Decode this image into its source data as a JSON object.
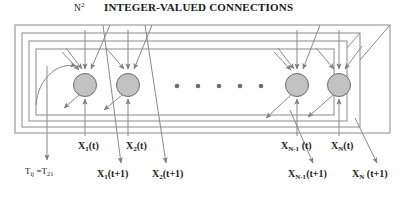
{
  "figure": {
    "title_prefix": "N",
    "title_superscript": "2",
    "title_main": "INTEGER-VALUED CONNECTIONS",
    "weight_label_prefix": "T",
    "weight_label_sub1": "ij",
    "weight_label_mid": " =T",
    "weight_label_sub2": "21"
  },
  "colors": {
    "node_fill": "#c2c2c2",
    "node_stroke": "#6b6b6b",
    "line": "#8a8a8a",
    "box": "#8a8a8a",
    "text": "#1a1a1a",
    "dot": "#6e6e6e",
    "background": "#ffffff"
  },
  "nodes": [
    {
      "id": "n1",
      "cx": 85,
      "cy": 85,
      "r": 11.5,
      "label_t": "X",
      "label_t_sub": "1",
      "label_t_suffix": "(t)",
      "label_t1": "X",
      "label_t1_sub": "1",
      "label_t1_suffix": "(t+1)"
    },
    {
      "id": "n2",
      "cx": 128,
      "cy": 85,
      "r": 11.5,
      "label_t": "X",
      "label_t_sub": "2",
      "label_t_suffix": "(t)",
      "label_t1": "X",
      "label_t1_sub": "2",
      "label_t1_suffix": "(t+1)"
    },
    {
      "id": "nN1",
      "cx": 297,
      "cy": 85,
      "r": 11.5,
      "label_t": "X",
      "label_t_sub": "N-1",
      "label_t_suffix": " (t)",
      "label_t1": "X",
      "label_t1_sub": "N-1",
      "label_t1_suffix": "(t+1)"
    },
    {
      "id": "nN",
      "cx": 339,
      "cy": 85,
      "r": 11.5,
      "label_t": "X",
      "label_t_sub": "N",
      "label_t_suffix": "(t)",
      "label_t1": "X",
      "label_t1_sub": "N",
      "label_t1_suffix": " (t+1)"
    }
  ],
  "ellipsis_dots": {
    "count": 5,
    "y": 86,
    "xs": [
      177,
      198,
      219,
      240,
      261
    ],
    "r": 2.3
  },
  "feedback_boxes": [
    {
      "index": 1,
      "x": 15,
      "y": 25,
      "w": 375,
      "h": 108
    },
    {
      "index": 2,
      "x": 22,
      "y": 33,
      "w": 338,
      "h": 94
    },
    {
      "index": 3,
      "x": 29,
      "y": 41,
      "w": 318,
      "h": 80
    },
    {
      "index": 4,
      "x": 36,
      "y": 49,
      "w": 298,
      "h": 66
    }
  ],
  "labels_top_row": [
    {
      "key": "x1t",
      "left": 78,
      "top": 140
    },
    {
      "key": "x2t",
      "left": 126,
      "top": 140
    },
    {
      "key": "xN1t",
      "left": 283,
      "top": 140
    },
    {
      "key": "xNt",
      "left": 331,
      "top": 140
    }
  ],
  "labels_bottom_row": [
    {
      "key": "x1t1",
      "left": 97,
      "top": 168
    },
    {
      "key": "x2t1",
      "left": 152,
      "top": 168
    },
    {
      "key": "xN1t1",
      "left": 291,
      "top": 168
    },
    {
      "key": "xNt1",
      "left": 352,
      "top": 168
    }
  ],
  "weight_label_position": {
    "left": 25,
    "top": 166
  }
}
